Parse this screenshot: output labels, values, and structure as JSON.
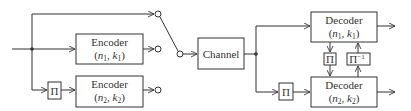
{
  "diagram": {
    "encoders": [
      {
        "label": "Encoder",
        "params": "(n1, k1)",
        "n": "n",
        "n_sub": "1",
        "k": "k",
        "k_sub": "1"
      },
      {
        "label": "Encoder",
        "params": "(n2, k2)",
        "n": "n",
        "n_sub": "2",
        "k": "k",
        "k_sub": "2"
      }
    ],
    "interleaver_label": "Π",
    "deinterleaver_label": "Π",
    "deinterleaver_sup": "−1",
    "channel_label": "Channel",
    "decoders": [
      {
        "label": "Decoder",
        "n": "n",
        "n_sub": "1",
        "k": "k",
        "k_sub": "1"
      },
      {
        "label": "Decoder",
        "n": "n",
        "n_sub": "2",
        "k": "k",
        "k_sub": "2"
      }
    ],
    "line_color": "#333333"
  }
}
